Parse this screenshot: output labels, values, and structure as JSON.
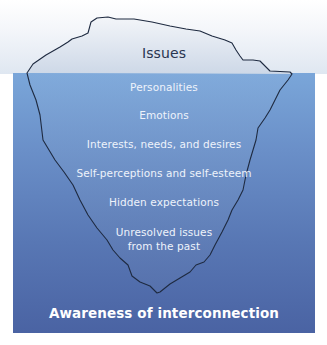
{
  "diagram": {
    "type": "iceberg",
    "above_water_label": "Issues",
    "below_water_labels": [
      "Personalities",
      "Emotions",
      "Interests, needs, and desires",
      "Self-perceptions and self-esteem",
      "Hidden expectations",
      "Unresolved issues",
      "from the past"
    ],
    "footer_label": "Awareness of interconnection",
    "colors": {
      "water_top": "#7aa6d9",
      "water_bottom": "#4a63a3",
      "outline": "#1e2a40",
      "above_text": "#2a3550",
      "below_text": "#eef3fb"
    }
  }
}
